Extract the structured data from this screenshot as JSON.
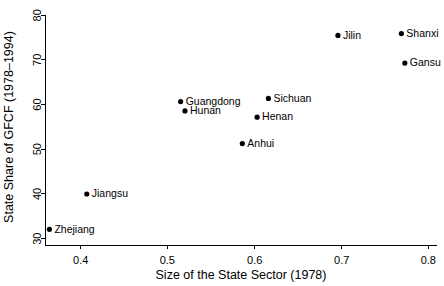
{
  "chart_data": {
    "type": "scatter",
    "title": "",
    "xlabel": "Size of the State Sector (1978)",
    "ylabel": "State Share of GFCF (1978–1994)",
    "xlim": [
      0.355,
      0.8
    ],
    "ylim": [
      29.0,
      81.5
    ],
    "xticks": [
      0.4,
      0.5,
      0.6,
      0.7,
      0.8
    ],
    "xticklabels": [
      "0.4",
      "0.5",
      "0.6",
      "0.7",
      "0.8"
    ],
    "yticks": [
      30,
      40,
      50,
      60,
      70,
      80
    ],
    "yticklabels": [
      "30",
      "40",
      "50",
      "60",
      "70",
      "80"
    ],
    "grid": false,
    "legend": null,
    "marker": "filled-circle",
    "marker_color": "#000000",
    "points": [
      {
        "label": "Zhejiang",
        "x": 0.364,
        "y": 32.1,
        "label_side": "right"
      },
      {
        "label": "Jiangsu",
        "x": 0.407,
        "y": 40.0,
        "label_side": "right"
      },
      {
        "label": "Guangdong",
        "x": 0.515,
        "y": 60.7,
        "label_side": "right"
      },
      {
        "label": "Hunan",
        "x": 0.52,
        "y": 58.6,
        "label_side": "right"
      },
      {
        "label": "Anhui",
        "x": 0.586,
        "y": 51.3,
        "label_side": "right"
      },
      {
        "label": "Henan",
        "x": 0.603,
        "y": 57.2,
        "label_side": "right"
      },
      {
        "label": "Sichuan",
        "x": 0.616,
        "y": 61.4,
        "label_side": "right"
      },
      {
        "label": "Jilin",
        "x": 0.696,
        "y": 75.5,
        "label_side": "right"
      },
      {
        "label": "Gansu",
        "x": 0.773,
        "y": 69.3,
        "label_side": "right"
      },
      {
        "label": "Shanxi",
        "x": 0.769,
        "y": 75.9,
        "label_side": "right"
      }
    ]
  },
  "layout": {
    "plot_left_px": 45,
    "plot_right_px": 437,
    "plot_top_px": 10,
    "plot_bottom_px": 245,
    "x_axis_y_px": 245,
    "y_axis_x_px": 45,
    "x_tick_px": {
      "0.4": 80.7,
      "0.5": 167.3,
      "0.6": 254.7,
      "0.7": 341.7,
      "0.8": 428.3
    },
    "y_tick_px": {
      "30": 238.7,
      "40": 193.9,
      "50": 149.2,
      "60": 104.5,
      "70": 59.8,
      "80": 15.3
    },
    "dot_radius_px": 2.6,
    "label_offset_px": 5,
    "axis_color": "#000000",
    "background": "#ffffff"
  }
}
